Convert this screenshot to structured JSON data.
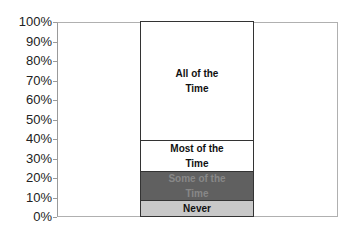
{
  "chart_data": {
    "type": "bar",
    "stacked": true,
    "percent_stacked": true,
    "title": "",
    "xlabel": "",
    "ylabel": "",
    "ylim": [
      0,
      100
    ],
    "yticks": [
      "0%",
      "10%",
      "20%",
      "30%",
      "40%",
      "50%",
      "60%",
      "70%",
      "80%",
      "90%",
      "100%"
    ],
    "grid": false,
    "legend": "none",
    "categories": [
      ""
    ],
    "series": [
      {
        "name": "Never",
        "values": [
          8
        ],
        "color": "#c8c8c8",
        "label_color": "#111111"
      },
      {
        "name": "Some of the Time",
        "values": [
          15
        ],
        "color": "#606060",
        "label_color": "#888888"
      },
      {
        "name": "Most of the Time",
        "values": [
          16
        ],
        "color": "#ffffff",
        "label_color": "#111111"
      },
      {
        "name": "All of the Time",
        "values": [
          61
        ],
        "color": "#ffffff",
        "label_color": "#111111"
      }
    ]
  },
  "labels": {
    "never": [
      "Never"
    ],
    "some": [
      "Some of the",
      "Time"
    ],
    "most": [
      "Most of the",
      "Time"
    ],
    "all": [
      "All of the",
      "Time"
    ]
  }
}
